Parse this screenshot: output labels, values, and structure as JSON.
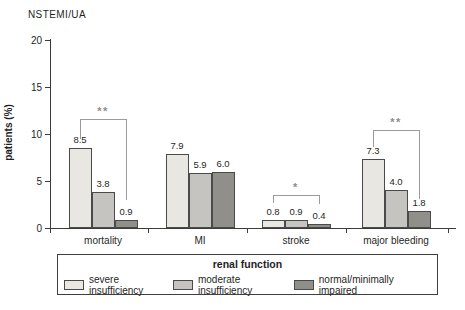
{
  "chart_data": {
    "type": "bar",
    "title": "NSTEMI/UA",
    "ylabel": "patients (%)",
    "ylim": [
      0,
      20
    ],
    "yticks": [
      0,
      5,
      10,
      15,
      20
    ],
    "grid": false,
    "categories": [
      "mortality",
      "MI",
      "stroke",
      "major bleeding"
    ],
    "series": [
      {
        "name": "severe insufficiency",
        "color": "#e8e7e2",
        "values": [
          8.5,
          7.9,
          0.8,
          7.3
        ]
      },
      {
        "name": "moderate insufficiency",
        "color": "#c5c4c0",
        "values": [
          3.8,
          5.9,
          0.9,
          4.0
        ]
      },
      {
        "name": "normal/minimally impaired",
        "color": "#918f89",
        "values": [
          0.9,
          6.0,
          0.4,
          1.8
        ]
      }
    ],
    "legend": {
      "title": "renal function",
      "position": "bottom",
      "entries": [
        "severe insufficiency",
        "moderate insufficiency",
        "normal/minimally impaired"
      ]
    },
    "significance_brackets": [
      {
        "category": "mortality",
        "label": "**",
        "from_series": "severe insufficiency",
        "to_series": "normal/minimally impaired",
        "bracket_y_pct": 11.6,
        "left_end_pct": 9.5,
        "right_end_pct": 3.0
      },
      {
        "category": "stroke",
        "label": "*",
        "from_series": "severe insufficiency",
        "to_series": "normal/minimally impaired",
        "bracket_y_pct": 3.5,
        "left_end_pct": 2.7,
        "right_end_pct": 2.6
      },
      {
        "category": "major bleeding",
        "label": "**",
        "from_series": "severe insufficiency",
        "to_series": "normal/minimally impaired",
        "bracket_y_pct": 10.4,
        "left_end_pct": 8.6,
        "right_end_pct": 3.1
      }
    ],
    "colors": {
      "axis": "#3c3c3c",
      "text": "#1f1f1f",
      "bracket": "#9b9b9b",
      "bar_border": "#4a4a4a"
    }
  }
}
